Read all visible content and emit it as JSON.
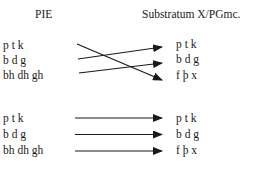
{
  "headers": {
    "left": "PIE",
    "right": "Substratum X/PGmc."
  },
  "top_block": {
    "left": [
      "p t k",
      "b d g",
      "bh dh gh"
    ],
    "right": [
      "p t k",
      "b d g",
      "f þ x"
    ],
    "mappings": [
      {
        "from": 0,
        "to": 2
      },
      {
        "from": 1,
        "to": 0
      },
      {
        "from": 2,
        "to": 1
      }
    ]
  },
  "bottom_block": {
    "left": [
      "p t k",
      "b d g",
      "bh dh gh"
    ],
    "right": [
      "p t k",
      "b d g",
      "f þ x"
    ],
    "mappings": [
      {
        "from": 0,
        "to": 0
      },
      {
        "from": 1,
        "to": 1
      },
      {
        "from": 2,
        "to": 2
      }
    ]
  },
  "colors": {
    "ink": "#1a1a1a",
    "background": "#ffffff"
  }
}
